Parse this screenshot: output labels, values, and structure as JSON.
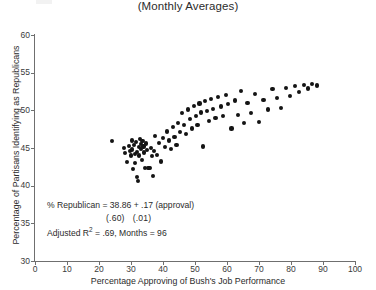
{
  "title": "(Monthly Averages)",
  "annotation": {
    "equation": "% Republican = 38.86 + .17 (approval)",
    "std_error_intercept": "(.60)",
    "std_error_slope": "(.01)",
    "fit_prefix": "Adjusted R",
    "fit_superscript": "2",
    "fit_rest": " = .69, Months = 96"
  },
  "chart_data": {
    "type": "scatter",
    "title": "(Monthly Averages)",
    "xlabel": "Percentage Approving of Bush's Job Performance",
    "ylabel": "Percentage of Partisans Identifying as Republicans",
    "xlim": [
      0,
      100
    ],
    "ylim": [
      30,
      60
    ],
    "xticks": [
      0,
      10,
      20,
      30,
      40,
      50,
      60,
      70,
      80,
      90,
      100
    ],
    "yticks": [
      30,
      35,
      40,
      45,
      50,
      55,
      60
    ],
    "grid": false,
    "legend": null,
    "n_points": 96,
    "regression": {
      "intercept": 38.86,
      "slope": 0.17,
      "se_intercept": 0.6,
      "se_slope": 0.01,
      "adjusted_r2": 0.69,
      "months": 96
    },
    "points": [
      [
        24.0,
        45.9
      ],
      [
        27.8,
        45.0
      ],
      [
        28.2,
        44.3
      ],
      [
        28.8,
        43.1
      ],
      [
        29.3,
        45.3
      ],
      [
        29.6,
        44.6
      ],
      [
        30.0,
        44.0
      ],
      [
        30.2,
        46.0
      ],
      [
        30.4,
        44.8
      ],
      [
        30.6,
        42.2
      ],
      [
        30.9,
        45.4
      ],
      [
        31.2,
        44.2
      ],
      [
        31.3,
        43.0
      ],
      [
        31.6,
        45.8
      ],
      [
        31.8,
        44.5
      ],
      [
        32.0,
        41.1
      ],
      [
        32.1,
        40.6
      ],
      [
        32.4,
        45.1
      ],
      [
        32.6,
        44.0
      ],
      [
        32.8,
        46.2
      ],
      [
        33.0,
        45.5
      ],
      [
        33.2,
        44.9
      ],
      [
        33.4,
        43.4
      ],
      [
        33.6,
        45.9
      ],
      [
        33.9,
        45.2
      ],
      [
        34.1,
        44.4
      ],
      [
        34.4,
        42.3
      ],
      [
        34.6,
        45.6
      ],
      [
        34.9,
        44.7
      ],
      [
        35.2,
        42.3
      ],
      [
        35.6,
        42.3
      ],
      [
        35.9,
        42.3
      ],
      [
        36.2,
        45.0
      ],
      [
        36.5,
        43.9
      ],
      [
        36.8,
        41.3
      ],
      [
        37.2,
        44.6
      ],
      [
        37.6,
        46.6
      ],
      [
        38.2,
        44.1
      ],
      [
        38.8,
        45.7
      ],
      [
        39.4,
        43.2
      ],
      [
        40.0,
        46.3
      ],
      [
        40.6,
        45.1
      ],
      [
        41.2,
        47.2
      ],
      [
        41.8,
        46.0
      ],
      [
        42.4,
        44.9
      ],
      [
        43.0,
        47.8
      ],
      [
        43.6,
        46.5
      ],
      [
        44.2,
        45.4
      ],
      [
        44.8,
        48.3
      ],
      [
        45.4,
        47.1
      ],
      [
        46.0,
        49.6
      ],
      [
        46.6,
        48.0
      ],
      [
        47.2,
        46.9
      ],
      [
        47.8,
        50.1
      ],
      [
        48.4,
        48.8
      ],
      [
        49.0,
        47.6
      ],
      [
        49.6,
        50.6
      ],
      [
        50.2,
        49.3
      ],
      [
        50.8,
        48.1
      ],
      [
        51.4,
        50.9
      ],
      [
        52.0,
        49.7
      ],
      [
        52.6,
        45.2
      ],
      [
        53.2,
        51.2
      ],
      [
        53.8,
        49.9
      ],
      [
        54.4,
        48.6
      ],
      [
        55.0,
        51.5
      ],
      [
        55.6,
        50.2
      ],
      [
        56.4,
        49.0
      ],
      [
        57.2,
        51.8
      ],
      [
        58.0,
        50.5
      ],
      [
        58.8,
        49.2
      ],
      [
        59.6,
        52.0
      ],
      [
        60.4,
        50.8
      ],
      [
        61.4,
        47.6
      ],
      [
        62.4,
        51.3
      ],
      [
        63.4,
        49.4
      ],
      [
        64.4,
        52.6
      ],
      [
        65.4,
        48.3
      ],
      [
        66.4,
        51.0
      ],
      [
        67.6,
        49.6
      ],
      [
        68.8,
        52.2
      ],
      [
        70.0,
        48.5
      ],
      [
        71.4,
        51.4
      ],
      [
        72.8,
        50.1
      ],
      [
        74.2,
        52.8
      ],
      [
        75.6,
        51.6
      ],
      [
        77.0,
        50.3
      ],
      [
        78.4,
        53.0
      ],
      [
        79.8,
        51.9
      ],
      [
        81.2,
        53.2
      ],
      [
        82.6,
        52.4
      ],
      [
        84.0,
        53.4
      ],
      [
        85.4,
        52.9
      ],
      [
        86.6,
        53.5
      ],
      [
        88.0,
        53.3
      ]
    ]
  }
}
